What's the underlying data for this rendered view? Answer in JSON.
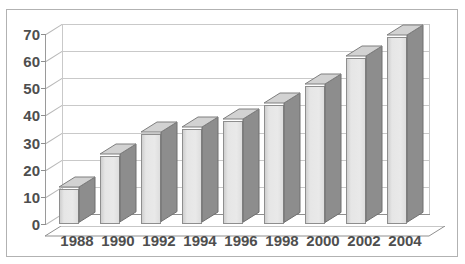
{
  "page": {
    "title_fragment": "",
    "background_color": "#ffffff",
    "frame_border_color": "#b2b2b2"
  },
  "chart_data": {
    "type": "bar",
    "title": "",
    "subtitle": "",
    "xlabel": "",
    "ylabel": "",
    "categories": [
      "1988",
      "1990",
      "1992",
      "1994",
      "1996",
      "1998",
      "2000",
      "2002",
      "2004"
    ],
    "values": [
      13,
      25,
      33,
      35,
      38,
      44,
      51,
      61,
      69
    ],
    "series": [
      {
        "name": "",
        "values": [
          13,
          25,
          33,
          35,
          38,
          44,
          51,
          61,
          69
        ]
      }
    ],
    "ylim": [
      0,
      70
    ],
    "ytick_values": [
      0,
      10,
      20,
      30,
      40,
      50,
      60,
      70
    ],
    "ytick_labels": [
      "0",
      "10",
      "20",
      "30",
      "40",
      "50",
      "60",
      "70"
    ],
    "grid": true,
    "grid_axis": "y",
    "legend": false,
    "legend_position": "none",
    "style": "3d-column",
    "bar_front_color": "#e6e6e6",
    "bar_side_color": "#8d8d8d",
    "bar_top_color": "#d2d2d2",
    "bar_outline_color": "#8e8e8e",
    "gridline_color": "#c9c9c9",
    "axis_color": "#8f8f8f",
    "tick_label_color": "#4e4e4e",
    "annotations": []
  }
}
